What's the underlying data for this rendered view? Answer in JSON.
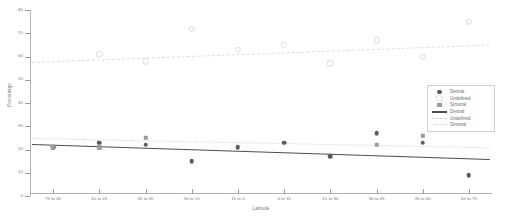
{
  "chart_data": {
    "type": "scatter",
    "title": "",
    "xlabel": "Latitude",
    "ylabel": "Percentage",
    "ylim": [
      0,
      80
    ],
    "yticks": [
      0,
      10,
      20,
      30,
      40,
      50,
      60,
      70,
      80
    ],
    "ytick_labels": [
      "0",
      "10",
      "20",
      "30",
      "40",
      "50",
      "60",
      "70",
      "80"
    ],
    "categories": [
      "75 to 60",
      "60 to 45",
      "45 to 30",
      "30 to 15",
      "15 to 0",
      "0 to 15",
      "15 to 30",
      "30 to 45",
      "45 to 60",
      "60 to 75"
    ],
    "grid": false,
    "legend_position": "right",
    "series": [
      {
        "name": "Dextral",
        "marker": "filled-circle",
        "color": "#5b5b5b",
        "values": [
          21,
          23,
          22,
          15,
          21,
          23,
          17,
          27,
          23,
          9
        ]
      },
      {
        "name": "Undefined",
        "marker": "open-circle",
        "color": "#dcdcdc",
        "values": [
          null,
          61,
          58,
          72,
          63,
          65,
          57,
          67,
          60,
          75
        ]
      },
      {
        "name": "Sinistral",
        "marker": "square",
        "color": "#9b9b9b",
        "values": [
          21,
          21,
          25,
          null,
          null,
          null,
          null,
          22,
          26,
          null
        ]
      }
    ],
    "trendlines": [
      {
        "name": "Dextral",
        "style": "solid",
        "color": "#4d4d4d",
        "y_start": 22.5,
        "y_end": 16.0
      },
      {
        "name": "Undefined",
        "style": "dashed",
        "color": "#dedede",
        "y_start": 57.5,
        "y_end": 65.0
      },
      {
        "name": "Sinistral",
        "style": "dotted",
        "color": "#d9d9d9",
        "y_start": 25.0,
        "y_end": 21.0
      }
    ]
  },
  "legend": {
    "items": [
      {
        "label": "Dextral",
        "key": "marker-filled-circle"
      },
      {
        "label": "Undefined",
        "key": "marker-open-circle"
      },
      {
        "label": "Sinistral",
        "key": "marker-square"
      },
      {
        "label": "Dextral",
        "key": "line-solid"
      },
      {
        "label": "Undefined",
        "key": "line-dashed"
      },
      {
        "label": "Sinistral",
        "key": "line-dotted"
      }
    ]
  }
}
